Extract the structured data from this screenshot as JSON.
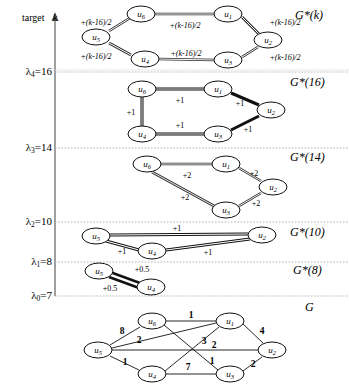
{
  "figure": {
    "axis": {
      "target_label": "target",
      "axis_variable": "k",
      "x": 55,
      "top_y": 18,
      "bottom_y": 296
    },
    "thresholds": [
      {
        "name": "lambda_4",
        "sub": "4",
        "prefix": "λ",
        "eq": "=16",
        "value": 16,
        "y": 72,
        "text": "λ4=16"
      },
      {
        "name": "lambda_3",
        "sub": "3",
        "prefix": "λ",
        "eq": "=14",
        "value": 14,
        "y": 148,
        "text": "λ3=14"
      },
      {
        "name": "lambda_2",
        "sub": "2",
        "prefix": "λ",
        "eq": "=10",
        "value": 10,
        "y": 222,
        "text": "λ2=10"
      },
      {
        "name": "lambda_1",
        "sub": "1",
        "prefix": "λ",
        "eq": "=8",
        "value": 8,
        "y": 262,
        "text": "λ1=8"
      },
      {
        "name": "lambda_0",
        "sub": "0",
        "prefix": "λ",
        "eq": "=7",
        "value": 7,
        "y": 296,
        "text": "λ0=7"
      }
    ],
    "graph_labels": [
      {
        "name": "g-star-k",
        "text": "G*(k)",
        "italic_arg": true,
        "x": 295,
        "y": 16
      },
      {
        "name": "g-star-16",
        "text": "G*(16)",
        "italic_arg": false,
        "x": 293,
        "y": 82
      },
      {
        "name": "g-star-14",
        "text": "G*(14)",
        "italic_arg": false,
        "x": 293,
        "y": 155
      },
      {
        "name": "g-star-10",
        "text": "G*(10)",
        "italic_arg": false,
        "x": 293,
        "y": 228
      },
      {
        "name": "g-star-8",
        "text": "G*(8)",
        "italic_arg": false,
        "x": 295,
        "y": 267
      },
      {
        "name": "g-plain",
        "text": "G",
        "italic_arg": false,
        "x": 305,
        "y": 302
      }
    ],
    "graphs": [
      {
        "id": "gk",
        "title": "G*(k)",
        "nodes": [
          {
            "id": "u6",
            "label": "u",
            "sub": "6",
            "x": 141,
            "y": 14
          },
          {
            "id": "u1",
            "label": "u",
            "sub": "1",
            "x": 228,
            "y": 14
          },
          {
            "id": "u2",
            "label": "u",
            "sub": "2",
            "x": 268,
            "y": 40
          },
          {
            "id": "u3",
            "label": "u",
            "sub": "3",
            "x": 228,
            "y": 60
          },
          {
            "id": "u4",
            "label": "u",
            "sub": "4",
            "x": 145,
            "y": 59
          },
          {
            "id": "u5",
            "label": "u",
            "sub": "5",
            "x": 96,
            "y": 37
          }
        ],
        "edges": [
          {
            "from": "u6",
            "to": "u1",
            "label": "+(k-16)/2",
            "lx": 185,
            "ly": 25,
            "style": "double"
          },
          {
            "from": "u1",
            "to": "u2",
            "label": "+(k-16)/2",
            "lx": 283,
            "ly": 23,
            "style": "double"
          },
          {
            "from": "u2",
            "to": "u3",
            "label": "+(k-16)/2",
            "lx": 284,
            "ly": 57,
            "style": "double"
          },
          {
            "from": "u3",
            "to": "u4",
            "label": "+(k-16)/2",
            "lx": 186,
            "ly": 53,
            "style": "double"
          },
          {
            "from": "u4",
            "to": "u5",
            "label": "+(k-16)/2",
            "lx": 96,
            "ly": 56,
            "style": "double"
          },
          {
            "from": "u5",
            "to": "u6",
            "label": "+(k-16)/2",
            "lx": 96,
            "ly": 23,
            "style": "double"
          }
        ]
      },
      {
        "id": "g16",
        "title": "G*(16)",
        "nodes": [
          {
            "id": "u6",
            "label": "u",
            "sub": "6",
            "x": 142,
            "y": 89
          },
          {
            "id": "u1",
            "label": "u",
            "sub": "1",
            "x": 218,
            "y": 89
          },
          {
            "id": "u2",
            "label": "u",
            "sub": "2",
            "x": 271,
            "y": 110
          },
          {
            "id": "u3",
            "label": "u",
            "sub": "3",
            "x": 218,
            "y": 134
          },
          {
            "id": "u4",
            "label": "u",
            "sub": "4",
            "x": 142,
            "y": 134
          }
        ],
        "edges": [
          {
            "from": "u6",
            "to": "u1",
            "label": "+1",
            "lx": 180,
            "ly": 99,
            "style": "double"
          },
          {
            "from": "u1",
            "to": "u2",
            "label": "+1",
            "lx": 240,
            "ly": 102,
            "style": "thick"
          },
          {
            "from": "u2",
            "to": "u3",
            "label": "+1",
            "lx": 248,
            "ly": 129,
            "style": "thick"
          },
          {
            "from": "u3",
            "to": "u4",
            "label": "+1",
            "lx": 180,
            "ly": 126,
            "style": "double"
          },
          {
            "from": "u4",
            "to": "u6",
            "label": "+1",
            "lx": 132,
            "ly": 112,
            "style": "thick"
          }
        ]
      },
      {
        "id": "g14",
        "title": "G*(14)",
        "nodes": [
          {
            "id": "u6",
            "label": "u",
            "sub": "6",
            "x": 147,
            "y": 164
          },
          {
            "id": "u1",
            "label": "u",
            "sub": "1",
            "x": 226,
            "y": 164
          },
          {
            "id": "u2",
            "label": "u",
            "sub": "2",
            "x": 273,
            "y": 187
          },
          {
            "id": "u3",
            "label": "u",
            "sub": "3",
            "x": 226,
            "y": 210
          }
        ],
        "edges": [
          {
            "from": "u6",
            "to": "u1",
            "label": "+2",
            "lx": 187,
            "ly": 174,
            "style": "double"
          },
          {
            "from": "u1",
            "to": "u2",
            "label": "+2",
            "lx": 253,
            "ly": 173,
            "style": "double"
          },
          {
            "from": "u2",
            "to": "u3",
            "label": "+2",
            "lx": 256,
            "ly": 202,
            "style": "double"
          },
          {
            "from": "u6",
            "to": "u3",
            "label": "+2",
            "lx": 186,
            "ly": 196,
            "style": "double"
          }
        ]
      },
      {
        "id": "g10",
        "title": "G*(10)",
        "nodes": [
          {
            "id": "u5",
            "label": "u",
            "sub": "5",
            "x": 96,
            "y": 236
          },
          {
            "id": "u2",
            "label": "u",
            "sub": "2",
            "x": 262,
            "y": 235
          },
          {
            "id": "u4",
            "label": "u",
            "sub": "4",
            "x": 152,
            "y": 251
          }
        ],
        "edges": [
          {
            "from": "u5",
            "to": "u2",
            "label": "+1",
            "lx": 177,
            "ly": 228,
            "style": "double"
          },
          {
            "from": "u5",
            "to": "u4",
            "label": "+1",
            "lx": 122,
            "ly": 250,
            "style": "double"
          },
          {
            "from": "u4",
            "to": "u2",
            "label": "+1",
            "lx": 208,
            "ly": 251,
            "style": "double"
          }
        ]
      },
      {
        "id": "g8",
        "title": "G*(8)",
        "nodes": [
          {
            "id": "u5",
            "label": "u",
            "sub": "5",
            "x": 99,
            "y": 271
          },
          {
            "id": "u4",
            "label": "u",
            "sub": "4",
            "x": 151,
            "y": 287
          }
        ],
        "edges": [
          {
            "from": "u5",
            "to": "u4",
            "label": "+0.5",
            "lx": 141,
            "ly": 269,
            "style": "double"
          },
          {
            "from": "u5",
            "to": "u4",
            "label": "+0.5",
            "lx": 110,
            "ly": 287,
            "style": "double"
          }
        ]
      },
      {
        "id": "g",
        "title": "G",
        "nodes": [
          {
            "id": "u6",
            "label": "u",
            "sub": "6",
            "x": 152,
            "y": 321
          },
          {
            "id": "u1",
            "label": "u",
            "sub": "1",
            "x": 230,
            "y": 321
          },
          {
            "id": "u2",
            "label": "u",
            "sub": "2",
            "x": 272,
            "y": 350
          },
          {
            "id": "u3",
            "label": "u",
            "sub": "3",
            "x": 230,
            "y": 374
          },
          {
            "id": "u4",
            "label": "u",
            "sub": "4",
            "x": 152,
            "y": 374
          },
          {
            "id": "u5",
            "label": "u",
            "sub": "5",
            "x": 98,
            "y": 350
          }
        ],
        "edges": [
          {
            "from": "u6",
            "to": "u1",
            "weight": "1",
            "lx": 191,
            "ly": 316,
            "style": "thin"
          },
          {
            "from": "u5",
            "to": "u6",
            "weight": "8",
            "lx": 122,
            "ly": 331,
            "style": "thin"
          },
          {
            "from": "u5",
            "to": "u1",
            "weight": "2",
            "lx": 138,
            "ly": 340,
            "style": "thin"
          },
          {
            "from": "u6",
            "to": "u3",
            "weight": "3",
            "lx": 203,
            "ly": 341,
            "style": "thin"
          },
          {
            "from": "u5",
            "to": "u2",
            "weight": "2",
            "lx": 213,
            "ly": 345,
            "style": "thin"
          },
          {
            "from": "u5",
            "to": "u4",
            "weight": "1",
            "lx": 125,
            "ly": 362,
            "style": "thin"
          },
          {
            "from": "u4",
            "to": "u1",
            "weight": "1",
            "lx": 212,
            "ly": 361,
            "style": "thin"
          },
          {
            "from": "u4",
            "to": "u3",
            "weight": "7",
            "lx": 188,
            "ly": 367,
            "style": "thin"
          },
          {
            "from": "u3",
            "to": "u2",
            "weight": "2",
            "lx": 253,
            "ly": 364,
            "style": "thin"
          },
          {
            "from": "u1",
            "to": "u2",
            "weight": "4",
            "lx": 262,
            "ly": 331,
            "style": "thin"
          }
        ]
      }
    ]
  }
}
